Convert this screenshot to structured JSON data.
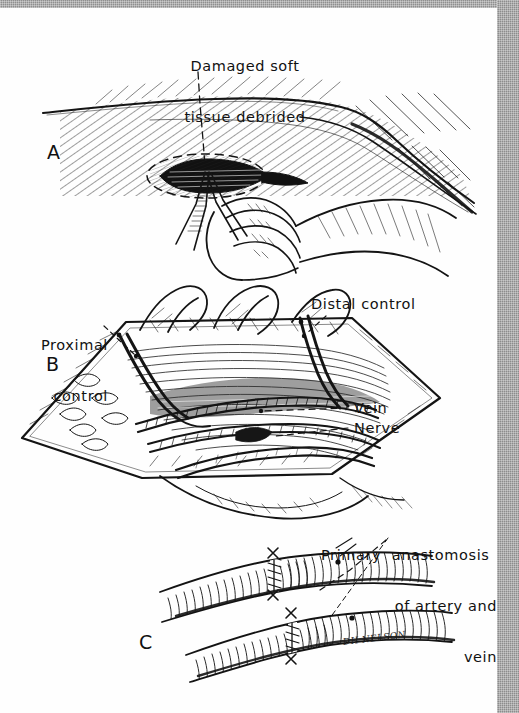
{
  "figure": {
    "kind": "medical-line-illustration",
    "ink_color": "#111111",
    "paper_color": "#fefefe",
    "gutter_color": "#8c8c8c"
  },
  "panels": [
    {
      "id": "A",
      "letter": "A",
      "caption": "Damaged soft tissue debrided",
      "caption_lines": [
        "Damaged soft",
        "tissue debrided"
      ],
      "description": "Limb surface in cross profile with hatched shading; debrided wound outlined by dashed oval; surgeon's hand holding forceps at the wound"
    },
    {
      "id": "B",
      "letter": "B",
      "labels": [
        {
          "name": "proximal-control",
          "lines": [
            "Proximal",
            "control"
          ],
          "text": "Proximal control"
        },
        {
          "name": "distal-control",
          "lines": [
            "Distal control"
          ],
          "text": "Distal control"
        },
        {
          "name": "vein",
          "lines": [
            "Vein"
          ],
          "text": "Vein"
        },
        {
          "name": "nerve",
          "lines": [
            "Nerve"
          ],
          "text": "Nerve"
        }
      ],
      "description": "Opened wound retracted with vessel loops; artery, vein and nerve exposed in the surgical field"
    },
    {
      "id": "C",
      "letter": "C",
      "caption": "Primary anastomosis of artery and vein",
      "caption_lines": [
        "Primary  anastomosis",
        "of artery and",
        "vein"
      ],
      "description": "Two divided tubular vessels joined end to end by sutured anastomoses"
    }
  ],
  "artist_signature": "DH NELSON"
}
